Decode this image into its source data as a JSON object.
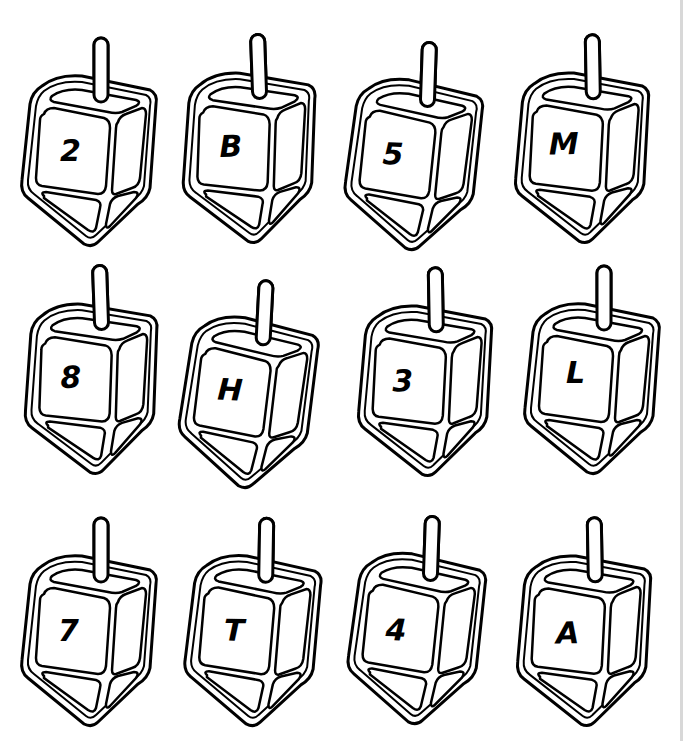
{
  "worksheet": {
    "layout": {
      "rows": 3,
      "columns": 4
    },
    "colors": {
      "line": "#000000",
      "fill": "#ffffff",
      "background": "#ffffff"
    },
    "dreidels": [
      {
        "label": "2",
        "row": 0,
        "col": 0
      },
      {
        "label": "B",
        "row": 0,
        "col": 1
      },
      {
        "label": "5",
        "row": 0,
        "col": 2
      },
      {
        "label": "M",
        "row": 0,
        "col": 3
      },
      {
        "label": "8",
        "row": 1,
        "col": 0
      },
      {
        "label": "H",
        "row": 1,
        "col": 1
      },
      {
        "label": "3",
        "row": 1,
        "col": 2
      },
      {
        "label": "L",
        "row": 1,
        "col": 3
      },
      {
        "label": "7",
        "row": 2,
        "col": 0
      },
      {
        "label": "T",
        "row": 2,
        "col": 1
      },
      {
        "label": "4",
        "row": 2,
        "col": 2
      },
      {
        "label": "A",
        "row": 2,
        "col": 3
      }
    ]
  }
}
